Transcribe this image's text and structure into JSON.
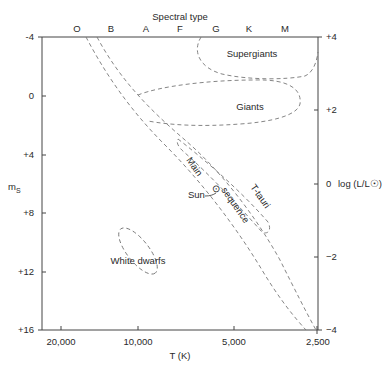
{
  "diagram": {
    "title": "Spectral type",
    "spectral_types": [
      "O",
      "B",
      "A",
      "F",
      "G",
      "K",
      "M"
    ],
    "left_axis": {
      "label": "m",
      "label_sub": "S",
      "ticks": [
        "-4",
        "0",
        "+4",
        "+8",
        "+12",
        "+16"
      ]
    },
    "right_axis": {
      "label": "log (L/L☉)",
      "ticks": [
        "+4",
        "+2",
        "0",
        "−2",
        "−4"
      ]
    },
    "bottom_axis": {
      "label": "T (K)",
      "ticks": [
        "20,000",
        "10,000",
        "5,000",
        "2,500"
      ]
    },
    "regions": {
      "supergiants": "Supergiants",
      "giants": "Giants",
      "white_dwarfs": "White dwarfs",
      "main_word1": "Main",
      "main_word2": "sequence",
      "t_tauri": "T-tauri",
      "sun": "Sun",
      "sun_symbol": "⊙"
    },
    "colors": {
      "axis": "#444444",
      "dash": "#777777",
      "text": "#2a2a2a"
    }
  }
}
